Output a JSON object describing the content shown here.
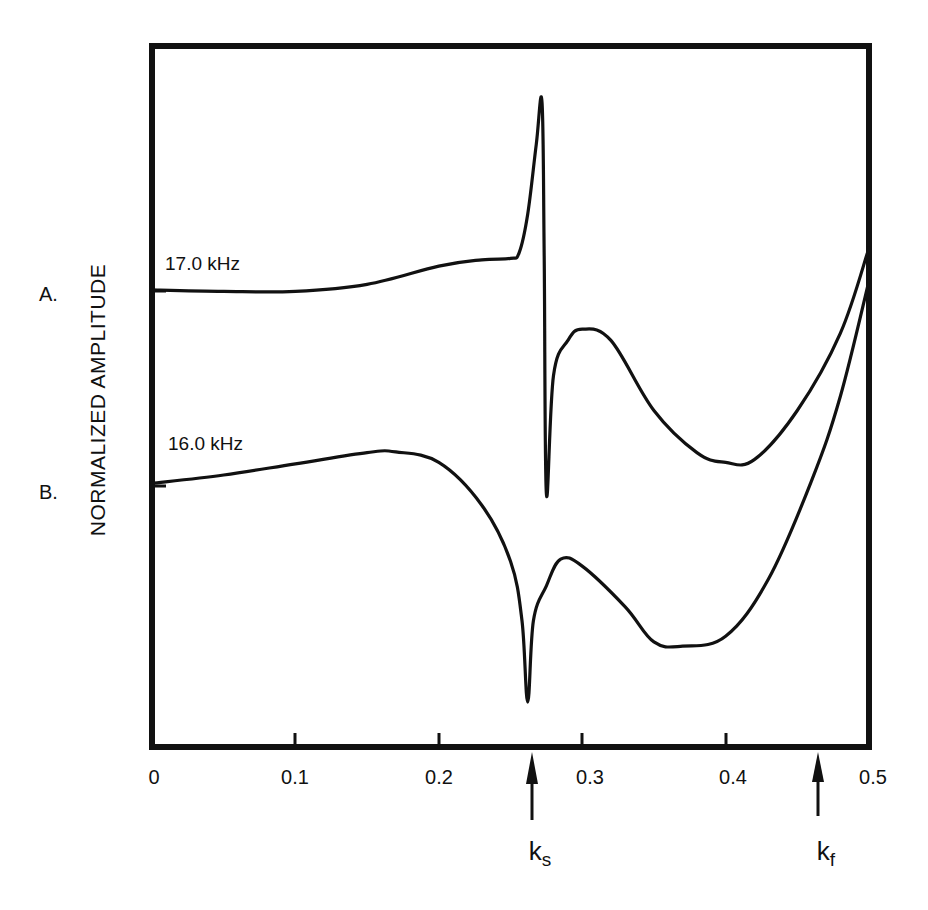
{
  "chart_data": {
    "type": "line",
    "title": "",
    "xlabel": "",
    "ylabel": "NORMALIZED AMPLITUDE",
    "xlim": [
      0,
      0.5
    ],
    "x_ticks": [
      "0",
      "0.1",
      "0.2",
      "0.3",
      "0.4",
      "0.5"
    ],
    "grid": false,
    "legend": "none (inline curve labels)",
    "series": [
      {
        "name": "A.",
        "label": "17.0 kHz",
        "note": "relative amplitude in arbitrary units (0 = bottom of frame, 1 = top of frame); curve offset vertically",
        "x": [
          0.0,
          0.05,
          0.1,
          0.15,
          0.2,
          0.23,
          0.25,
          0.256,
          0.262,
          0.268,
          0.272,
          0.2735,
          0.275,
          0.28,
          0.29,
          0.3,
          0.32,
          0.35,
          0.38,
          0.4,
          0.42,
          0.45,
          0.48,
          0.5
        ],
        "y": [
          0.652,
          0.65,
          0.65,
          0.66,
          0.686,
          0.695,
          0.697,
          0.705,
          0.76,
          0.86,
          0.92,
          0.7,
          0.361,
          0.53,
          0.58,
          0.596,
          0.58,
          0.48,
          0.42,
          0.406,
          0.41,
          0.48,
          0.59,
          0.712
        ]
      },
      {
        "name": "B.",
        "label": "16.0 kHz",
        "note": "relative amplitude in arbitrary units (0 = bottom of frame, 1 = top of frame); curve offset vertically",
        "x": [
          0.0,
          0.05,
          0.1,
          0.15,
          0.17,
          0.2,
          0.23,
          0.25,
          0.258,
          0.262,
          0.266,
          0.275,
          0.285,
          0.3,
          0.33,
          0.35,
          0.37,
          0.4,
          0.43,
          0.46,
          0.48,
          0.5
        ],
        "y": [
          0.376,
          0.388,
          0.404,
          0.42,
          0.421,
          0.406,
          0.345,
          0.265,
          0.18,
          0.064,
          0.18,
          0.23,
          0.268,
          0.258,
          0.2,
          0.15,
          0.144,
          0.158,
          0.24,
          0.38,
          0.5,
          0.665
        ]
      }
    ],
    "annotations": [
      {
        "text": "k_s",
        "x": 0.265,
        "type": "upward arrow below axis"
      },
      {
        "text": "k_f",
        "x": 0.464,
        "type": "upward arrow below axis"
      }
    ]
  },
  "labels": {
    "ylabel": "NORMALIZED AMPLITUDE",
    "curve_a_letter": "A.",
    "curve_b_letter": "B.",
    "curve_a_freq": "17.0 kHz",
    "curve_b_freq": "16.0 kHz",
    "ks_main": "k",
    "ks_sub": "s",
    "kf_main": "k",
    "kf_sub": "f"
  },
  "x_tick_labels": [
    "0",
    "0.1",
    "0.2",
    "0.3",
    "0.4",
    "0.5"
  ]
}
